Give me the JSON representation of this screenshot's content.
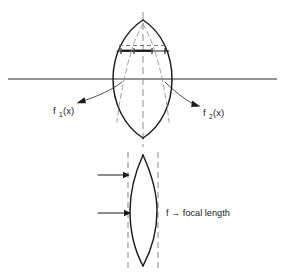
{
  "figure": {
    "background_color": "#ffffff",
    "ink_color": "#1a1a1a",
    "dash_color": "#8e8e8e",
    "width": 284,
    "height": 280
  },
  "upper_diagram": {
    "name": "lens-with-surface-functions",
    "lens": {
      "top_vertex_x": 143,
      "top_vertex_y": 20,
      "bottom_vertex_x": 143,
      "bottom_vertex_y": 138,
      "left_edge_x": 113,
      "right_edge_x": 172,
      "mid_y": 79
    },
    "optical_axis": {
      "label": "optical-axis",
      "y": 79,
      "x_start": 8,
      "x_end": 277
    },
    "center_line": {
      "label": "center-line",
      "x": 143,
      "y_start": 12,
      "y_end": 146,
      "style": "dashed"
    },
    "chord_band": {
      "label": "aperture-band",
      "dashed_chord_y": 45,
      "solid_band_y": 51,
      "left_x": 118,
      "right_x": 168,
      "tick_count": 4
    },
    "interior_rays": {
      "label": "converging-dashed-rays",
      "style": "dashed",
      "count": 2
    },
    "callouts": [
      {
        "id": "f1",
        "label": "f",
        "subscript": "1",
        "argument": "(x)",
        "text": "f₁ (x)",
        "text_x": 54,
        "text_y": 112,
        "arrow_tip_x": 79,
        "arrow_tip_y": 103,
        "arrow_from_x": 122,
        "arrow_from_y": 80
      },
      {
        "id": "f2",
        "label": "f",
        "subscript": "2",
        "argument": "(x)",
        "text": "f₂ (x)",
        "text_x": 199,
        "text_y": 114,
        "arrow_tip_x": 193,
        "arrow_tip_y": 106,
        "arrow_from_x": 166,
        "arrow_from_y": 80
      }
    ]
  },
  "lower_diagram": {
    "name": "lens-focal-length",
    "lens": {
      "top_vertex_x": 143,
      "top_vertex_y": 155,
      "bottom_vertex_x": 143,
      "bottom_vertex_y": 266,
      "left_edge_x": 130,
      "right_edge_x": 157,
      "mid_y": 211
    },
    "dashed_verticals": [
      {
        "id": "left-plane",
        "x": 128,
        "y_start": 152,
        "y_end": 270
      },
      {
        "id": "right-plane",
        "x": 158,
        "y_start": 152,
        "y_end": 270
      }
    ],
    "arrows": [
      {
        "id": "upper-ray",
        "y": 175,
        "x_start": 98,
        "x_end": 129,
        "direction": "right"
      },
      {
        "id": "lower-ray",
        "y": 213,
        "x_start": 98,
        "x_end": 131,
        "direction": "right"
      }
    ],
    "annotation": {
      "id": "focal-length-label",
      "symbol": "f",
      "arrow_glyph": "→",
      "text": "focal length",
      "full_text": "f → focal length",
      "x": 166,
      "y": 215
    }
  }
}
